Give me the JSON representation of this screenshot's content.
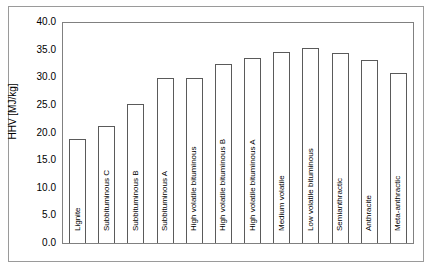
{
  "chart_data": {
    "type": "bar",
    "title": "",
    "xlabel": "",
    "ylabel": "HHV [MJ/kg]",
    "ylim": [
      0.0,
      40.0
    ],
    "ytick_step": 5.0,
    "grid": false,
    "legend": "none",
    "bar_style": {
      "fill": "#ffffff",
      "outline": "#5a5a5a"
    },
    "ytick_labels": [
      "40.0",
      "35.0",
      "30.0",
      "25.0",
      "20.0",
      "15.0",
      "10.0",
      "5.0",
      "0.0"
    ],
    "ytick_values": [
      40.0,
      35.0,
      30.0,
      25.0,
      20.0,
      15.0,
      10.0,
      5.0,
      0.0
    ],
    "categories": [
      "Lignite",
      "Subbituminous C",
      "Subbituminous B",
      "Subbituminous A",
      "High volatile bituminous",
      "High volatile bituminous B",
      "High volatile bituminous A",
      "Medium volatile",
      "Low volatile bituminous",
      "Semianthractic",
      "Anthracite",
      "Meta-anthractic"
    ],
    "values": [
      19.0,
      21.3,
      25.3,
      30.0,
      30.0,
      32.6,
      33.6,
      34.8,
      35.4,
      34.6,
      33.3,
      31.0
    ]
  }
}
